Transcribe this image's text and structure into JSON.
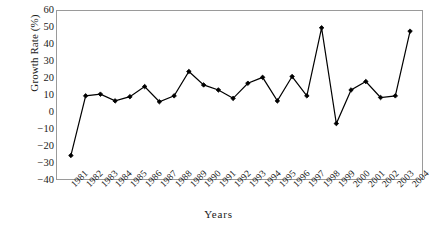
{
  "chart_data": {
    "type": "line",
    "title": "",
    "xlabel": "Years",
    "ylabel": "Growth Rate (%)",
    "categories": [
      "1981",
      "1982",
      "1983",
      "1984",
      "1985",
      "1986",
      "1987",
      "1988",
      "1989",
      "1990",
      "1991",
      "1992",
      "1993",
      "1994",
      "1995",
      "1996",
      "1997",
      "1998",
      "1999",
      "2000",
      "2001",
      "2002",
      "2003",
      "2004"
    ],
    "values": [
      -26,
      9.5,
      10.5,
      6.5,
      9,
      15,
      6,
      9.5,
      24,
      16,
      13,
      8,
      17,
      20.5,
      6.5,
      21,
      9.5,
      50,
      -7,
      13,
      18,
      8.5,
      9.5,
      48
    ],
    "series": [
      {
        "name": "Growth Rate",
        "values": [
          -26,
          9.5,
          10.5,
          6.5,
          9,
          15,
          6,
          9.5,
          24,
          16,
          13,
          8,
          17,
          20.5,
          6.5,
          21,
          9.5,
          50,
          -7,
          13,
          18,
          8.5,
          9.5,
          48
        ]
      }
    ],
    "ylim": [
      -40,
      60
    ],
    "yticks": [
      60,
      50,
      40,
      30,
      20,
      10,
      0,
      -10,
      -20,
      -30,
      -40
    ],
    "ytick_labels": [
      "60",
      "50",
      "40",
      "30",
      "20",
      "10",
      "0",
      "−10",
      "−20",
      "−30",
      "−40"
    ],
    "grid": false,
    "legend": null,
    "marker": "filled-diamond",
    "line_color": "#000000",
    "marker_color": "#000000",
    "frame_color": "#9a9a9a",
    "background": "#ffffff"
  }
}
